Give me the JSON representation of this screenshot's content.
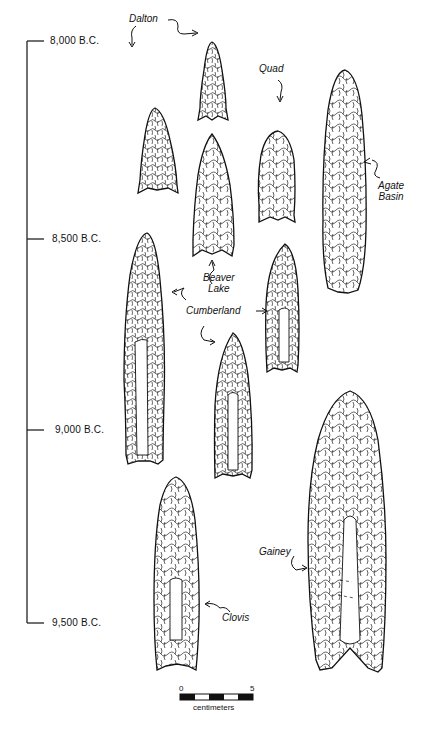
{
  "timeline": {
    "ticks": [
      {
        "label": "8,000 B.C.",
        "y": 41
      },
      {
        "label": "8,500 B.C.",
        "y": 239
      },
      {
        "label": "9,000 B.C.",
        "y": 430
      },
      {
        "label": "9,500 B.C.",
        "y": 623
      }
    ]
  },
  "points": {
    "dalton": {
      "label": "Dalton"
    },
    "quad": {
      "label": "Quad"
    },
    "agate_basin": {
      "label_line1": "Agate",
      "label_line2": "Basin"
    },
    "beaver_lake": {
      "label_line1": "Beaver",
      "label_line2": "Lake"
    },
    "cumberland": {
      "label": "Cumberland"
    },
    "gainey": {
      "label": "Gainey"
    },
    "clovis": {
      "label": "Clovis"
    }
  },
  "scale_bar": {
    "min_label": "0",
    "max_label": "5",
    "unit_label": "centimeters"
  }
}
